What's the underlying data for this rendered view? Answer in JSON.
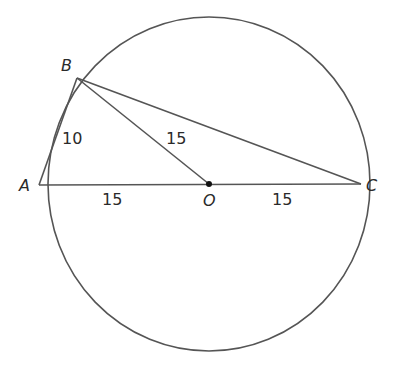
{
  "diagram": {
    "type": "circle-geometry",
    "stroke_color": "#555555",
    "circle": {
      "center": "O",
      "cx": 209,
      "cy": 184,
      "rx": 161,
      "ry": 167
    },
    "points": {
      "A": {
        "label": "A",
        "x": 39,
        "y": 185
      },
      "B": {
        "label": "B",
        "x": 77,
        "y": 78
      },
      "C": {
        "label": "C",
        "x": 361,
        "y": 184
      },
      "O": {
        "label": "O",
        "x": 209,
        "y": 184
      }
    },
    "segments": [
      {
        "from": "A",
        "to": "B",
        "length_label": "10"
      },
      {
        "from": "B",
        "to": "O",
        "length_label": "15"
      },
      {
        "from": "B",
        "to": "C",
        "length_label": ""
      },
      {
        "from": "A",
        "to": "O",
        "length_label": "15"
      },
      {
        "from": "O",
        "to": "C",
        "length_label": "15"
      }
    ],
    "labels": {
      "ab": "10",
      "bo": "15",
      "ao": "15",
      "oc": "15"
    }
  }
}
